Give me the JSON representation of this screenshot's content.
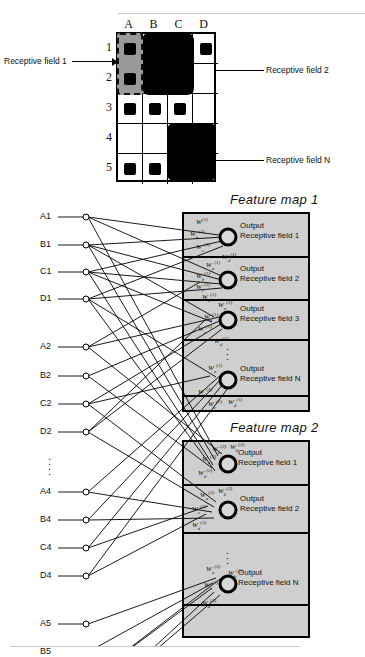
{
  "figure": {
    "top_rule": true,
    "bottom_rule": true
  },
  "grid": {
    "columns": [
      "A",
      "B",
      "C",
      "D"
    ],
    "rows": [
      "1",
      "2",
      "3",
      "4",
      "5"
    ],
    "cells": [
      [
        {
          "mark": "square"
        },
        {
          "mark": "blob"
        },
        {
          "mark": "blob"
        },
        {
          "mark": "square"
        }
      ],
      [
        {
          "mark": "square"
        },
        {
          "mark": "blob"
        },
        {
          "mark": "blob"
        },
        {
          "mark": "none"
        }
      ],
      [
        {
          "mark": "square"
        },
        {
          "mark": "square"
        },
        {
          "mark": "square"
        },
        {
          "mark": "none"
        }
      ],
      [
        {
          "mark": "none"
        },
        {
          "mark": "none"
        },
        {
          "mark": "blob"
        },
        {
          "mark": "blob"
        }
      ],
      [
        {
          "mark": "square"
        },
        {
          "mark": "square"
        },
        {
          "mark": "blob"
        },
        {
          "mark": "blob"
        }
      ]
    ],
    "annotations": {
      "rf1": "Receptive field 1",
      "rf2": "Receptive field 2",
      "rfN": "Receptive field N"
    }
  },
  "network": {
    "feature_maps": [
      {
        "title": "Feature map 1",
        "outputs": [
          {
            "line1": "Output",
            "line2": "Receptive field 1"
          },
          {
            "line1": "Output",
            "line2": "Receptive field 2"
          },
          {
            "line1": "Output",
            "line2": "Receptive field 3"
          },
          {
            "line1": "Output",
            "line2": "Receptive field N"
          }
        ],
        "ellipsis": "⋮"
      },
      {
        "title": "Feature map 2",
        "outputs": [
          {
            "line1": "Output",
            "line2": "Receptive field 1"
          },
          {
            "line1": "Output",
            "line2": "Receptive field 2"
          },
          {
            "line1": "Output",
            "line2": "Receptive field N"
          }
        ],
        "ellipsis": "⋮"
      }
    ],
    "input_groups": [
      {
        "labels": [
          "A1",
          "B1",
          "C1",
          "D1"
        ]
      },
      {
        "labels": [
          "A2",
          "B2",
          "C2",
          "D2"
        ]
      },
      {
        "labels": [
          "A4",
          "B4",
          "C4",
          "D4"
        ]
      },
      {
        "labels": [
          "A5",
          "B5",
          "C5",
          "D5"
        ]
      }
    ],
    "input_ellipsis": "⋮",
    "weight_symbol": "W",
    "weight_subscripts": [
      "a",
      "b",
      "c",
      "d"
    ],
    "weight_superscript": "(1)"
  },
  "colors": {
    "ink": "#000000",
    "feature_map_fill": "#cfcfcf",
    "receptive_field_1_fill": "#9a9a9a",
    "rule": "#c9c9c9",
    "page": "#ffffff"
  }
}
